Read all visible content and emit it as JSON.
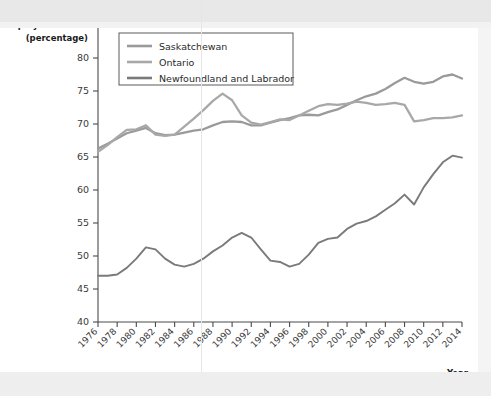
{
  "chart_data": {
    "type": "line",
    "title": "",
    "ylabel_line1": "Employment Rate",
    "ylabel_line2": "(percentage)",
    "xlabel": "Year",
    "ylim": [
      40,
      85
    ],
    "ytick_labels": [
      "40",
      "45",
      "50",
      "55",
      "60",
      "65",
      "70",
      "75",
      "80",
      "85"
    ],
    "ytick_values": [
      40,
      45,
      50,
      55,
      60,
      65,
      70,
      75,
      80,
      85
    ],
    "xlim": [
      1976,
      2014
    ],
    "xtick_labels": [
      "1976",
      "1978",
      "1980",
      "1982",
      "1984",
      "1986",
      "1988",
      "1990",
      "1992",
      "1994",
      "1996",
      "1998",
      "2000",
      "2002",
      "2004",
      "2006",
      "2008",
      "2010",
      "2012",
      "2014"
    ],
    "xtick_values": [
      1976,
      1978,
      1980,
      1982,
      1984,
      1986,
      1988,
      1990,
      1992,
      1994,
      1996,
      1998,
      2000,
      2002,
      2004,
      2006,
      2008,
      2010,
      2012,
      2014
    ],
    "grid": false,
    "legend_position": "upper-left-inside",
    "x": [
      1976,
      1977,
      1978,
      1979,
      1980,
      1981,
      1982,
      1983,
      1984,
      1985,
      1986,
      1987,
      1988,
      1989,
      1990,
      1991,
      1992,
      1993,
      1994,
      1995,
      1996,
      1997,
      1998,
      1999,
      2000,
      2001,
      2002,
      2003,
      2004,
      2005,
      2006,
      2007,
      2008,
      2009,
      2010,
      2011,
      2012,
      2013,
      2014
    ],
    "series": [
      {
        "name": "Saskatchewan",
        "color": "#9a9a9a",
        "values": [
          66.3,
          67.0,
          67.8,
          68.6,
          69.0,
          69.4,
          68.6,
          68.3,
          68.4,
          68.7,
          69.0,
          69.2,
          69.8,
          70.3,
          70.4,
          70.3,
          69.8,
          69.8,
          70.2,
          70.6,
          70.9,
          71.3,
          71.4,
          71.3,
          71.8,
          72.2,
          72.9,
          73.6,
          74.2,
          74.6,
          75.3,
          76.2,
          77.0,
          76.4,
          76.1,
          76.4,
          77.2,
          77.5,
          76.9
        ]
      },
      {
        "name": "Ontario",
        "color": "#a8a8a8",
        "values": [
          65.8,
          66.8,
          68.0,
          69.1,
          69.2,
          69.8,
          68.4,
          68.2,
          68.4,
          69.6,
          70.8,
          72.1,
          73.5,
          74.6,
          73.6,
          71.3,
          70.2,
          69.9,
          70.3,
          70.7,
          70.6,
          71.3,
          72.0,
          72.7,
          73.0,
          72.9,
          73.1,
          73.4,
          73.2,
          72.9,
          73.0,
          73.2,
          72.9,
          70.4,
          70.6,
          70.9,
          70.9,
          71.0,
          71.3
        ]
      },
      {
        "name": "Newfoundland and Labrador",
        "color": "#7a7a7a",
        "values": [
          47.0,
          47.0,
          47.2,
          48.2,
          49.6,
          51.3,
          51.0,
          49.6,
          48.7,
          48.4,
          48.8,
          49.6,
          50.7,
          51.6,
          52.8,
          53.5,
          52.8,
          51.0,
          49.3,
          49.1,
          48.4,
          48.8,
          50.2,
          52.0,
          52.6,
          52.8,
          54.1,
          54.9,
          55.3,
          56.0,
          57.0,
          58.0,
          59.3,
          57.8,
          60.4,
          62.4,
          64.2,
          65.2,
          64.9
        ]
      }
    ]
  },
  "legend": {
    "entries": [
      {
        "label": "Saskatchewan"
      },
      {
        "label": "Ontario"
      },
      {
        "label": "Newfoundland and Labrador"
      }
    ]
  }
}
